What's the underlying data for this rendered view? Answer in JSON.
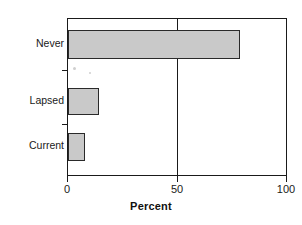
{
  "chart_data": {
    "type": "bar",
    "orientation": "horizontal",
    "title": "",
    "xlabel": "Percent",
    "ylabel": "",
    "categories": [
      "Never",
      "Lapsed",
      "Current"
    ],
    "values": [
      79,
      14,
      8
    ],
    "series": [
      {
        "name": "Percent",
        "values": [
          79,
          14,
          8
        ]
      }
    ],
    "xlim": [
      0,
      100
    ],
    "xticks": [
      0,
      50,
      100
    ],
    "xtick_labels": [
      "0",
      "50",
      "100"
    ],
    "ytick_labels": [
      "Never",
      "Lapsed",
      "Current"
    ],
    "grid": "vertical-at-50",
    "legend": "none",
    "bar_fill_color": "#c9c9c9",
    "bar_edge_color": "#2a2a2a",
    "axis_color": "#1a1a1a"
  },
  "axes": {
    "x_title": "Percent",
    "tick_0": "0",
    "tick_50": "50",
    "tick_100": "100"
  },
  "categories": {
    "never": "Never",
    "lapsed": "Lapsed",
    "current": "Current"
  },
  "title_remnant": ""
}
